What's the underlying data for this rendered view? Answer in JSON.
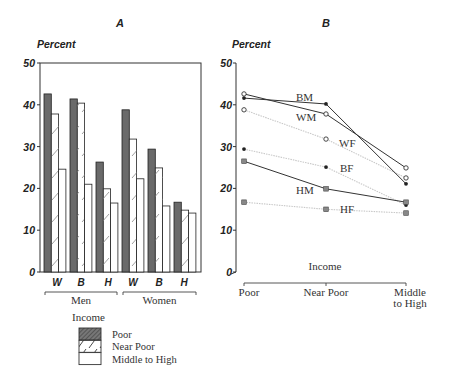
{
  "chart_data": [
    {
      "panel": "A",
      "type": "bar",
      "title": "A",
      "ylabel": "Percent",
      "xlabel": "Income",
      "ylim": [
        0,
        50
      ],
      "yticks": [
        "0",
        "10",
        "20",
        "30",
        "40",
        "50"
      ],
      "groups": [
        {
          "label": "Men",
          "categories": [
            "W",
            "B",
            "H"
          ]
        },
        {
          "label": "Women",
          "categories": [
            "W",
            "B",
            "H"
          ]
        }
      ],
      "categories": [
        "W (Men)",
        "B (Men)",
        "H (Men)",
        "W (Women)",
        "B (Women)",
        "H (Women)"
      ],
      "category_labels": [
        "W",
        "B",
        "H",
        "W",
        "B",
        "H"
      ],
      "series": [
        {
          "name": "Poor",
          "values": [
            42.6,
            41.4,
            26.3,
            38.8,
            29.4,
            16.7
          ]
        },
        {
          "name": "Near Poor",
          "values": [
            37.8,
            40.4,
            19.9,
            31.8,
            24.9,
            14.8
          ]
        },
        {
          "name": "Middle to High",
          "values": [
            24.6,
            21.0,
            16.5,
            22.3,
            15.8,
            14.1
          ]
        }
      ],
      "legend": {
        "title": "Income",
        "entries": [
          "Poor",
          "Near Poor",
          "Middle to High"
        ],
        "position": "bottom"
      },
      "grid": false
    },
    {
      "panel": "B",
      "type": "line",
      "title": "B",
      "ylabel": "Percent",
      "xlabel": "Income",
      "ylim": [
        0,
        50
      ],
      "yticks": [
        "0",
        "10",
        "20",
        "30",
        "40",
        "50"
      ],
      "x": [
        "Poor",
        "Near Poor",
        "Middle to High"
      ],
      "series": [
        {
          "name": "WM",
          "style": "solid",
          "marker": "open-circle",
          "values": [
            42.6,
            37.8,
            24.9
          ]
        },
        {
          "name": "BM",
          "style": "solid",
          "marker": "filled-circle",
          "values": [
            41.6,
            40.2,
            21.1
          ]
        },
        {
          "name": "WF",
          "style": "dotted",
          "marker": "open-circle",
          "values": [
            38.8,
            31.8,
            22.5
          ]
        },
        {
          "name": "BF",
          "style": "dotted",
          "marker": "filled-circle",
          "values": [
            29.4,
            25.1,
            16.0
          ]
        },
        {
          "name": "HM",
          "style": "solid",
          "marker": "square",
          "values": [
            26.5,
            19.9,
            16.7
          ]
        },
        {
          "name": "HF",
          "style": "dotted",
          "marker": "square",
          "values": [
            16.7,
            15.0,
            14.1
          ]
        }
      ],
      "grid": false
    }
  ],
  "colors": {
    "poor_fill": "#6a6a6a",
    "axis": "#333333",
    "male_line": "#333333",
    "female_line": "#c8c8c8"
  }
}
